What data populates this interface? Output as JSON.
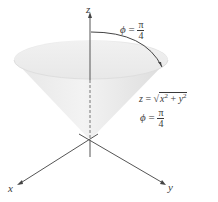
{
  "figure": {
    "type": "3d-cone-diagram",
    "axes": {
      "x_label": "x",
      "y_label": "y",
      "z_label": "z"
    },
    "angle_label_top": {
      "symbol": "ϕ",
      "equals": "=",
      "numerator": "π",
      "denominator": "4"
    },
    "surface_equation": {
      "lhs": "z",
      "equals": "=",
      "radicand_a": "x",
      "radicand_b": "y",
      "exponent": "2",
      "plus": "+"
    },
    "angle_label_side": {
      "symbol": "ϕ",
      "equals": "=",
      "numerator": "π",
      "denominator": "4"
    },
    "colors": {
      "cone_fill_light": "#f2f2f2",
      "cone_fill_dark": "#d9d9d9",
      "axis_stroke": "#555555",
      "text": "#3a3a3a"
    }
  }
}
